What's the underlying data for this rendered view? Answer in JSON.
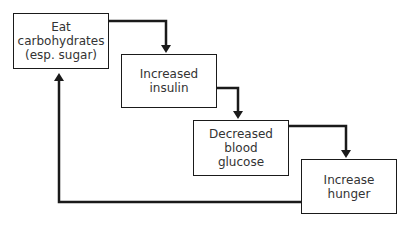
{
  "diagram": {
    "type": "flowchart-cycle",
    "nodes": [
      {
        "id": "eat-carbs",
        "label": "Eat\ncarbohydrates\n(esp. sugar)"
      },
      {
        "id": "increased-insulin",
        "label": "Increased\ninsulin"
      },
      {
        "id": "decreased-glucose",
        "label": "Decreased\nblood\nglucose"
      },
      {
        "id": "increase-hunger",
        "label": "Increase\nhunger"
      }
    ],
    "edges": [
      {
        "from": "eat-carbs",
        "to": "increased-insulin"
      },
      {
        "from": "increased-insulin",
        "to": "decreased-glucose"
      },
      {
        "from": "decreased-glucose",
        "to": "increase-hunger"
      },
      {
        "from": "increase-hunger",
        "to": "eat-carbs"
      }
    ],
    "colors": {
      "line": "#1a1a1a",
      "text": "#333333",
      "background": "#ffffff"
    }
  }
}
